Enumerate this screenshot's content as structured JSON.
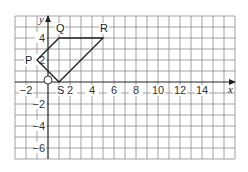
{
  "diagram": {
    "type": "coordinate-grid",
    "grid": {
      "x_min": -3,
      "x_max": 17,
      "y_min": -7,
      "y_max": 6,
      "origin_px": [
        48,
        82
      ],
      "unit_px": 11,
      "line_color": "#8a8a8a",
      "axis_color": "#222222"
    },
    "axes": {
      "x_label": "x",
      "y_label": "y",
      "origin_label": "O",
      "x_ticks": [
        {
          "value": -2,
          "label": "−2"
        },
        {
          "value": 2,
          "label": "2"
        },
        {
          "value": 4,
          "label": "4"
        },
        {
          "value": 6,
          "label": "6"
        },
        {
          "value": 8,
          "label": "8"
        },
        {
          "value": 10,
          "label": "10"
        },
        {
          "value": 12,
          "label": "12"
        },
        {
          "value": 14,
          "label": "14"
        }
      ],
      "y_ticks": [
        {
          "value": 4,
          "label": "4"
        },
        {
          "value": 2,
          "label": "2"
        },
        {
          "value": -2,
          "label": "−2"
        },
        {
          "value": -4,
          "label": "−4"
        },
        {
          "value": -6,
          "label": "−6"
        }
      ]
    },
    "shape": {
      "name": "quadrilateral PQRS",
      "stroke": "#222222",
      "vertices": [
        {
          "label": "P",
          "x": -1,
          "y": 2
        },
        {
          "label": "Q",
          "x": 1,
          "y": 4
        },
        {
          "label": "R",
          "x": 5,
          "y": 4
        },
        {
          "label": "S",
          "x": 1,
          "y": 0
        }
      ]
    }
  }
}
